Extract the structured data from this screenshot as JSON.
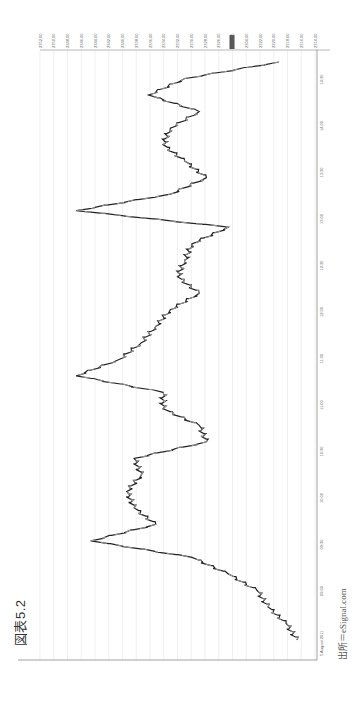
{
  "figure": {
    "title": "図表5.2",
    "source": "出所＝eSignal.com"
  },
  "chart_data": {
    "type": "line",
    "title": "図表5.2",
    "orientation": "rotated-90-clockwise",
    "xlabel": "Time",
    "ylabel": "Price",
    "date_label": "5 August 2011",
    "time_ticks": [
      "09:00",
      "09:30",
      "10:00",
      "10:30",
      "11:00",
      "11:30",
      "12:00",
      "12:30",
      "13:00",
      "13:30",
      "14:00",
      "14:30"
    ],
    "price_ticks": [
      "2352.00",
      "2350.00",
      "2348.00",
      "2346.00",
      "2344.00",
      "2342.00",
      "2340.00",
      "2338.00",
      "2336.00",
      "2334.00",
      "2332.00",
      "2330.00",
      "2328.00",
      "2326.00",
      "2306.00",
      "2304.00",
      "2322.00",
      "2320.00",
      "2318.00",
      "2316.00",
      "2314.00"
    ],
    "highlighted_price_label": "2306.00",
    "ylim": [
      2314,
      2352
    ],
    "grid": true,
    "series": [
      {
        "name": "Price",
        "color_up": "#999999",
        "color_down": "#222222",
        "x": [
          "09:00",
          "09:10",
          "09:20",
          "09:30",
          "09:40",
          "09:50",
          "10:00",
          "10:10",
          "10:20",
          "10:30",
          "10:40",
          "10:50",
          "11:00",
          "11:10",
          "11:20",
          "11:30",
          "11:40",
          "11:50",
          "12:00",
          "12:10",
          "12:20",
          "12:30",
          "12:40",
          "12:50",
          "13:00",
          "13:10",
          "13:20",
          "13:30",
          "13:40",
          "13:50",
          "14:00",
          "14:10",
          "14:20",
          "14:30",
          "14:40",
          "14:50"
        ],
        "values": [
          2316.5,
          2318,
          2320.5,
          2322,
          2326,
          2331,
          2345,
          2336,
          2339,
          2340,
          2338,
          2339,
          2329,
          2330,
          2335,
          2335,
          2347,
          2341,
          2338,
          2336,
          2334,
          2330,
          2333,
          2332,
          2331,
          2326,
          2347,
          2334,
          2329,
          2332,
          2335,
          2334,
          2330,
          2337,
          2332,
          2319
        ]
      }
    ]
  }
}
